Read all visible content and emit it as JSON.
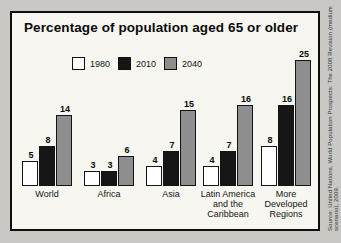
{
  "title": "Percentage of population aged 65 or older",
  "source_note": "Source: United Nations, World Population Prospects: The 2008 Revision (medium scenario), 2009.",
  "colors": {
    "frame_border": "#0e0e0e",
    "chart_background": "#f7f6f1",
    "page_background": "#c9c8c5",
    "bar_1980": "#ffffff",
    "bar_2010": "#161616",
    "bar_2040": "#8e8e8e"
  },
  "chart_data": {
    "type": "bar",
    "title": "Percentage of population aged 65 or older",
    "categories": [
      "World",
      "Africa",
      "Asia",
      "Latin America\nand the\nCaribbean",
      "More\nDeveloped\nRegions"
    ],
    "series": [
      {
        "name": "1980",
        "color": "#ffffff",
        "values": [
          5,
          3,
          4,
          4,
          8
        ]
      },
      {
        "name": "2010",
        "color": "#161616",
        "values": [
          8,
          3,
          7,
          7,
          16
        ]
      },
      {
        "name": "2040",
        "color": "#8e8e8e",
        "values": [
          14,
          6,
          15,
          16,
          25
        ]
      }
    ],
    "xlabel": "",
    "ylabel": "",
    "ylim": [
      0,
      25
    ],
    "grid": false,
    "legend_position": "top",
    "value_labels": true
  }
}
